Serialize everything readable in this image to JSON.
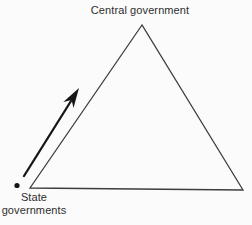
{
  "diagram": {
    "labels": {
      "top": "Central government",
      "bottom_left": "State\ngovernments"
    },
    "colors": {
      "background": "#fbfbfb",
      "triangle_line": "#3d3d3d",
      "arrow": "#161616",
      "text": "#2e2e2e"
    }
  }
}
